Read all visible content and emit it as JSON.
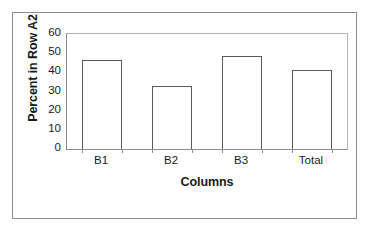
{
  "chart_data": {
    "type": "bar",
    "title": "",
    "subtitle": "",
    "xlabel": "Columns",
    "ylabel": "Percent in Row A2",
    "categories": [
      "B1",
      "B2",
      "B3",
      "Total"
    ],
    "values": [
      46.5,
      33.0,
      48.5,
      41.0
    ],
    "series": [
      {
        "name": "Percent in Row A2",
        "values": [
          46.5,
          33.0,
          48.5,
          41.0
        ]
      }
    ],
    "ylim": [
      0,
      60
    ],
    "yticks": [
      0,
      10,
      20,
      30,
      40,
      50,
      60
    ],
    "ytick_labels": [
      "0",
      "10",
      "20",
      "30",
      "40",
      "50",
      "60"
    ],
    "grid": false,
    "legend": false,
    "legend_position": "none",
    "annotations": [],
    "colors": {
      "bar_fill": "#ffffff",
      "bar_edge": "#5a5a5a",
      "axis": "#8c8c8c",
      "plot_frame": "#b5b5b5",
      "figure_border": "#8d8d8d",
      "text": "#1a1a1a",
      "background": "#ffffff"
    }
  }
}
